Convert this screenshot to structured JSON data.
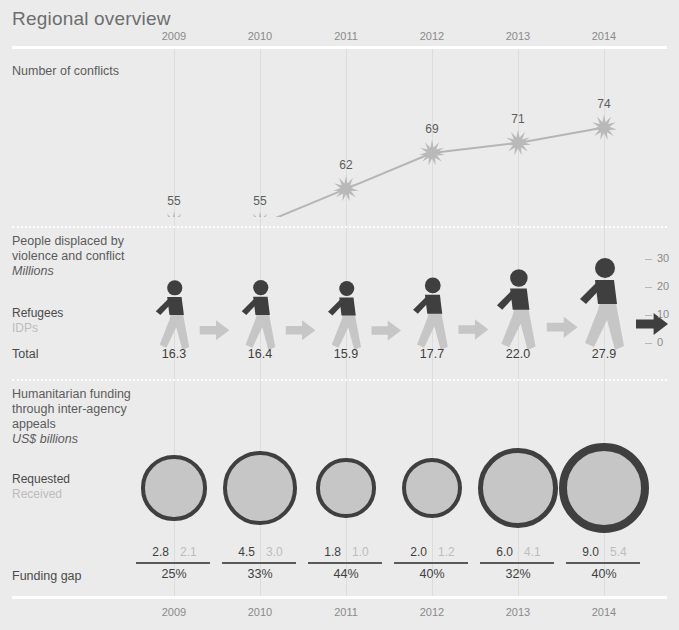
{
  "title": "Regional overview",
  "years": [
    "2009",
    "2010",
    "2011",
    "2012",
    "2013",
    "2014"
  ],
  "sections": {
    "conflicts": {
      "label": "Number of conflicts",
      "values": [
        55,
        55,
        62,
        69,
        71,
        74
      ]
    },
    "displacement": {
      "label_line1": "People displaced by",
      "label_line2": "violence and conflict",
      "unit": "Millions",
      "legend_refugees": "Refugees",
      "legend_idps": "IDPs",
      "total_label": "Total",
      "totals": [
        "16.3",
        "16.4",
        "15.9",
        "17.7",
        "22.0",
        "27.9"
      ],
      "axis_ticks": [
        "30",
        "20",
        "10",
        "0"
      ]
    },
    "funding": {
      "label_line1": "Humanitarian funding",
      "label_line2": "through inter-agency",
      "label_line3": "appeals",
      "unit": "US$ billions",
      "legend_requested": "Requested",
      "legend_received": "Received",
      "gap_label": "Funding gap",
      "requested": [
        "2.8",
        "4.5",
        "1.8",
        "2.0",
        "6.0",
        "9.0"
      ],
      "received": [
        "2.1",
        "3.0",
        "1.0",
        "1.2",
        "4.1",
        "5.4"
      ],
      "gaps": [
        "25%",
        "33%",
        "44%",
        "40%",
        "32%",
        "40%"
      ]
    }
  },
  "chart_data": [
    {
      "type": "line",
      "title": "Number of conflicts",
      "categories": [
        "2009",
        "2010",
        "2011",
        "2012",
        "2013",
        "2014"
      ],
      "values": [
        55,
        55,
        62,
        69,
        71,
        74
      ],
      "xlabel": "",
      "ylabel": "",
      "grid": true,
      "marker": "starburst"
    },
    {
      "type": "bar",
      "title": "People displaced by violence and conflict",
      "ylabel": "Millions",
      "categories": [
        "2009",
        "2010",
        "2011",
        "2012",
        "2013",
        "2014"
      ],
      "series": [
        {
          "name": "Refugees",
          "values": [
            null,
            null,
            null,
            null,
            null,
            null
          ]
        },
        {
          "name": "IDPs",
          "values": [
            null,
            null,
            null,
            null,
            null,
            null
          ]
        },
        {
          "name": "Total",
          "values": [
            16.3,
            16.4,
            15.9,
            17.7,
            22.0,
            27.9
          ]
        }
      ],
      "ylim": [
        0,
        30
      ],
      "yticks": [
        0,
        10,
        20,
        30
      ],
      "grid": false,
      "marker": "pictogram-walking-figure"
    },
    {
      "type": "bubble",
      "title": "Humanitarian funding through inter-agency appeals",
      "ylabel": "US$ billions",
      "categories": [
        "2009",
        "2010",
        "2011",
        "2012",
        "2013",
        "2014"
      ],
      "series": [
        {
          "name": "Requested",
          "values": [
            2.8,
            4.5,
            1.8,
            2.0,
            6.0,
            9.0
          ]
        },
        {
          "name": "Received",
          "values": [
            2.1,
            3.0,
            1.0,
            1.2,
            4.1,
            5.4
          ]
        }
      ],
      "annotations": {
        "Funding gap": [
          "25%",
          "33%",
          "44%",
          "40%",
          "32%",
          "40%"
        ]
      },
      "grid": true
    }
  ]
}
